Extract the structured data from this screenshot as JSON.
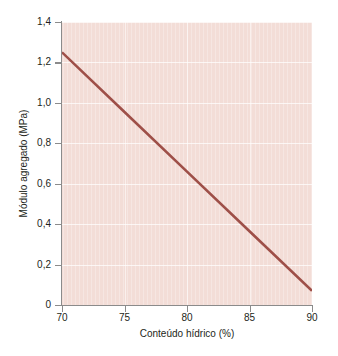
{
  "chart_data": {
    "type": "line",
    "title": "",
    "subtitle": "",
    "xlabel": "Conteúdo hídrico (%)",
    "ylabel": "Módulo agregado (MPa)",
    "xlim": [
      70,
      90
    ],
    "ylim": [
      0,
      1.4
    ],
    "xticks": [
      70,
      75,
      80,
      85,
      90
    ],
    "xticklabels": [
      "70",
      "75",
      "80",
      "85",
      "90"
    ],
    "yticks": [
      0,
      0.2,
      0.4,
      0.6,
      0.8,
      1.0,
      1.2,
      1.4
    ],
    "yticklabels": [
      "0",
      "0,2",
      "0,4",
      "0,6",
      "0,8",
      "1,0",
      "1,2",
      "1,4"
    ],
    "grid": true,
    "grid_color": "#ffffff",
    "legend": null,
    "legend_position": "none",
    "annotations": [],
    "panel_background": "#f3ddd7",
    "figure_background": "#ffffff",
    "axis_color": "#8b8b8b",
    "text_color": "#231f20",
    "series": [
      {
        "name": "Módulo agregado",
        "color": "#9e4f48",
        "line_width": 2.6,
        "x": [
          70,
          75,
          80,
          85,
          90
        ],
        "values": [
          1.25,
          0.955,
          0.66,
          0.365,
          0.07
        ]
      }
    ]
  }
}
